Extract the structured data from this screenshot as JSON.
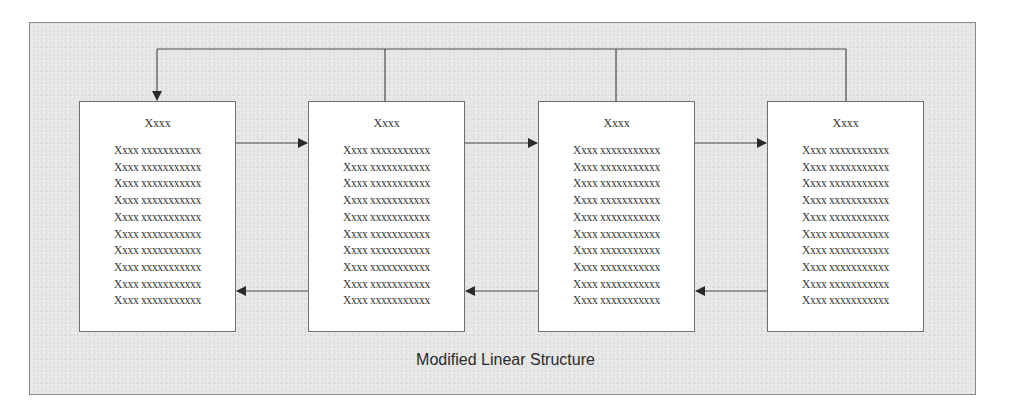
{
  "diagram": {
    "caption": "Modified Linear Structure",
    "colors": {
      "background_panel": "#e4e4e4",
      "panel_border": "#8a8a8a",
      "node_fill": "#ffffff",
      "node_border": "#6f6f6f",
      "connector": "#4a4a4a",
      "text": "#333333"
    },
    "nodes": [
      {
        "title": "Xxxx",
        "lines": [
          "Xxxx xxxxxxxxxxx",
          "Xxxx xxxxxxxxxxx",
          "Xxxx xxxxxxxxxxx",
          "Xxxx xxxxxxxxxxx",
          "Xxxx xxxxxxxxxxx",
          "Xxxx xxxxxxxxxxx",
          "Xxxx xxxxxxxxxxx",
          "Xxxx xxxxxxxxxxx",
          "Xxxx xxxxxxxxxxx",
          "Xxxx xxxxxxxxxxx"
        ]
      },
      {
        "title": "Xxxx",
        "lines": [
          "Xxxx xxxxxxxxxxx",
          "Xxxx xxxxxxxxxxx",
          "Xxxx xxxxxxxxxxx",
          "Xxxx xxxxxxxxxxx",
          "Xxxx xxxxxxxxxxx",
          "Xxxx xxxxxxxxxxx",
          "Xxxx xxxxxxxxxxx",
          "Xxxx xxxxxxxxxxx",
          "Xxxx xxxxxxxxxxx",
          "Xxxx xxxxxxxxxxx"
        ]
      },
      {
        "title": "Xxxx",
        "lines": [
          "Xxxx xxxxxxxxxxx",
          "Xxxx xxxxxxxxxxx",
          "Xxxx xxxxxxxxxxx",
          "Xxxx xxxxxxxxxxx",
          "Xxxx xxxxxxxxxxx",
          "Xxxx xxxxxxxxxxx",
          "Xxxx xxxxxxxxxxx",
          "Xxxx xxxxxxxxxxx",
          "Xxxx xxxxxxxxxxx",
          "Xxxx xxxxxxxxxxx"
        ]
      },
      {
        "title": "Xxxx",
        "lines": [
          "Xxxx xxxxxxxxxxx",
          "Xxxx xxxxxxxxxxx",
          "Xxxx xxxxxxxxxxx",
          "Xxxx xxxxxxxxxxx",
          "Xxxx xxxxxxxxxxx",
          "Xxxx xxxxxxxxxxx",
          "Xxxx xxxxxxxxxxx",
          "Xxxx xxxxxxxxxxx",
          "Xxxx xxxxxxxxxxx",
          "Xxxx xxxxxxxxxxx"
        ]
      }
    ],
    "edges": [
      {
        "from": 0,
        "to": 1,
        "direction": "forward"
      },
      {
        "from": 1,
        "to": 2,
        "direction": "forward"
      },
      {
        "from": 2,
        "to": 3,
        "direction": "forward"
      },
      {
        "from": 1,
        "to": 0,
        "direction": "backward"
      },
      {
        "from": 2,
        "to": 1,
        "direction": "backward"
      },
      {
        "from": 3,
        "to": 2,
        "direction": "backward"
      },
      {
        "from": 1,
        "to": 0,
        "direction": "return-to-first"
      },
      {
        "from": 2,
        "to": 0,
        "direction": "return-to-first"
      },
      {
        "from": 3,
        "to": 0,
        "direction": "return-to-first"
      }
    ]
  }
}
